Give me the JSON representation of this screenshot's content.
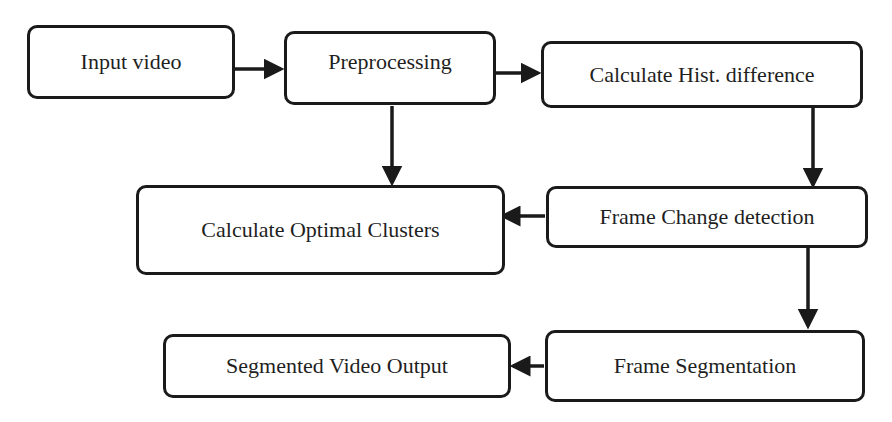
{
  "diagram": {
    "type": "flowchart",
    "nodes": [
      {
        "id": "input",
        "label": "Input video"
      },
      {
        "id": "pre",
        "label": "Preprocessing"
      },
      {
        "id": "hist",
        "label": "Calculate Hist. difference"
      },
      {
        "id": "clusters",
        "label": "Calculate Optimal Clusters"
      },
      {
        "id": "change",
        "label": "Frame Change detection"
      },
      {
        "id": "segout",
        "label": "Segmented Video Output"
      },
      {
        "id": "seg",
        "label": "Frame Segmentation"
      }
    ],
    "edges": [
      {
        "from": "input",
        "to": "pre"
      },
      {
        "from": "pre",
        "to": "hist"
      },
      {
        "from": "pre",
        "to": "clusters"
      },
      {
        "from": "hist",
        "to": "change"
      },
      {
        "from": "change",
        "to": "clusters"
      },
      {
        "from": "change",
        "to": "seg"
      },
      {
        "from": "seg",
        "to": "segout"
      }
    ]
  }
}
